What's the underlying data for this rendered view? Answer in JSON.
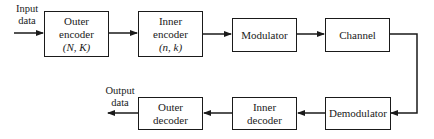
{
  "diagram": {
    "type": "block-diagram",
    "input_label": [
      "Input",
      "data"
    ],
    "output_label": [
      "Output",
      "data"
    ],
    "blocks": [
      {
        "id": "outer-encoder",
        "lines": [
          "Outer",
          "encoder"
        ],
        "params": "(N, K)"
      },
      {
        "id": "inner-encoder",
        "lines": [
          "Inner",
          "encoder"
        ],
        "params": "(n, k)"
      },
      {
        "id": "modulator",
        "lines": [
          "Modulator"
        ]
      },
      {
        "id": "channel",
        "lines": [
          "Channel"
        ]
      },
      {
        "id": "demodulator",
        "lines": [
          "Demodulator"
        ]
      },
      {
        "id": "inner-decoder",
        "lines": [
          "Inner",
          "decoder"
        ]
      },
      {
        "id": "outer-decoder",
        "lines": [
          "Outer",
          "decoder"
        ]
      }
    ],
    "flow": [
      "Input data",
      "outer-encoder",
      "inner-encoder",
      "modulator",
      "channel",
      "demodulator",
      "inner-decoder",
      "outer-decoder",
      "Output data"
    ],
    "colors": {
      "stroke": "#1a1a1a",
      "background": "#ffffff"
    }
  }
}
